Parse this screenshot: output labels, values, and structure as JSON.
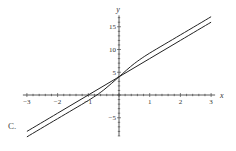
{
  "option_label": "C.",
  "chart_data": {
    "type": "line",
    "title": "",
    "xlabel": "x",
    "ylabel": "y",
    "xlim": [
      -3,
      3
    ],
    "ylim": [
      -9,
      17
    ],
    "x_ticks": [
      -3,
      -2,
      -1,
      1,
      2,
      3
    ],
    "y_ticks": [
      -5,
      5,
      10,
      15
    ],
    "grid": false,
    "legend": null,
    "series": [
      {
        "name": "straight line",
        "x": [
          -3,
          -2,
          -1,
          0,
          1,
          2,
          3
        ],
        "values": [
          -8,
          -4,
          0,
          4,
          8,
          12,
          16
        ]
      },
      {
        "name": "S-shaped curve",
        "x": [
          -3,
          -2,
          -1,
          -0.5,
          0,
          0.5,
          1,
          2,
          3
        ],
        "values": [
          -9.2,
          -5.2,
          -1.2,
          1.1,
          4,
          6.9,
          9.2,
          13.2,
          17.2
        ]
      }
    ],
    "colors": {
      "curve": "#222222",
      "axis": "#333333"
    }
  }
}
